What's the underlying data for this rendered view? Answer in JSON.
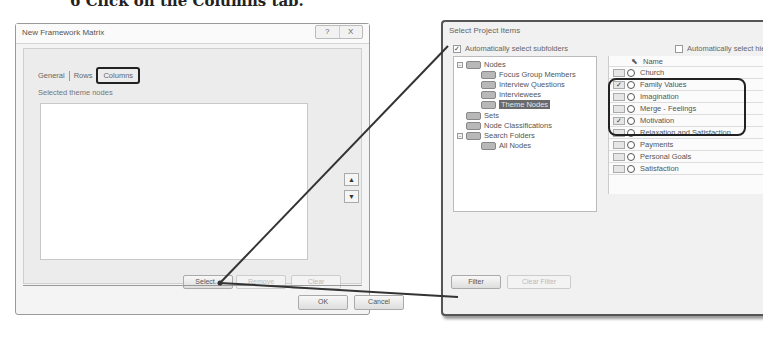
{
  "caption": "6   Click on the Columns tab.",
  "left_dialog": {
    "title": "New Framework Matrix",
    "window_buttons": [
      "?",
      "X"
    ],
    "tabs": [
      {
        "label": "General",
        "active": false
      },
      {
        "label": "Rows",
        "active": false
      },
      {
        "label": "Columns",
        "active": true
      }
    ],
    "section_label": "Selected theme nodes",
    "selected_nodes": [],
    "move_up": "▲",
    "move_down": "▼",
    "buttons": {
      "select": "Select...",
      "remove": "Remove",
      "clear": "Clear",
      "ok": "OK",
      "cancel": "Cancel"
    }
  },
  "right_dialog": {
    "title": "Select Project Items",
    "auto_select_subfolders": {
      "label": "Automatically select subfolders",
      "checked": true
    },
    "auto_select_hierarchy": {
      "label": "Automatically select hie",
      "checked": false
    },
    "tree": [
      {
        "label": "Nodes",
        "level": 0,
        "expander": "-"
      },
      {
        "label": "Focus Group Members",
        "level": 1
      },
      {
        "label": "Interview Questions",
        "level": 1
      },
      {
        "label": "Interviewees",
        "level": 1
      },
      {
        "label": "Theme Nodes",
        "level": 1,
        "selected": true
      },
      {
        "label": "Sets",
        "level": 0
      },
      {
        "label": "Node Classifications",
        "level": 0
      },
      {
        "label": "Search Folders",
        "level": 0,
        "expander": "-"
      },
      {
        "label": "All Nodes",
        "level": 1
      }
    ],
    "grid_header": "Name",
    "grid_rows": [
      {
        "name": "Church",
        "checked": false
      },
      {
        "name": "Family Values",
        "checked": true
      },
      {
        "name": "Imagination",
        "checked": false
      },
      {
        "name": "Merge - Feelings",
        "checked": false
      },
      {
        "name": "Motivation",
        "checked": true
      },
      {
        "name": "Relaxation and Satisfaction",
        "checked": false
      },
      {
        "name": "Payments",
        "checked": false
      },
      {
        "name": "Personal Goals",
        "checked": false
      },
      {
        "name": "Satisfaction",
        "checked": false
      }
    ],
    "bottom_label": "Se",
    "buttons": {
      "filter": "Filter",
      "clear_filter": "Clear Filter"
    }
  }
}
